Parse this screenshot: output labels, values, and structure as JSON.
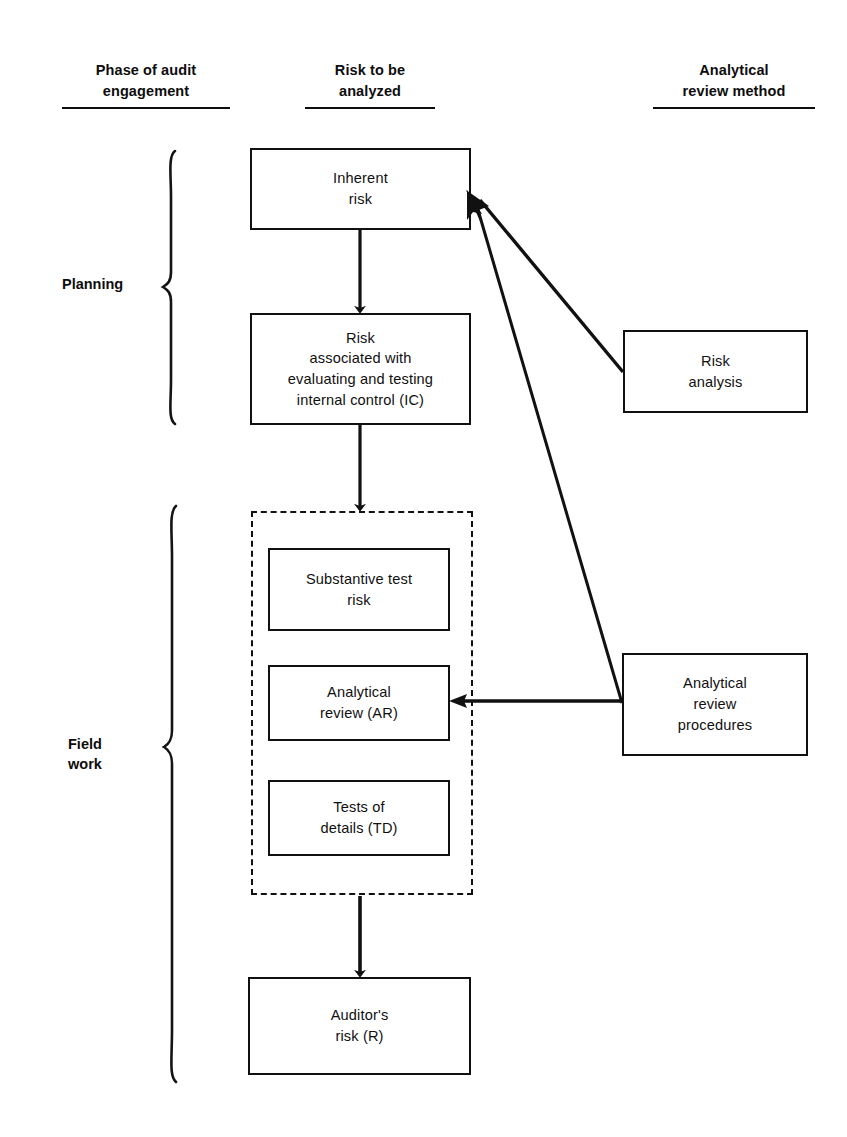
{
  "diagram": {
    "title_columns": [
      {
        "id": "phase",
        "text": "Phase of audit\nengagement"
      },
      {
        "id": "risk",
        "text": "Risk to be\nanalyzed"
      },
      {
        "id": "method",
        "text": "Analytical\nreview method"
      }
    ],
    "phases": [
      {
        "id": "planning",
        "label": "Planning"
      },
      {
        "id": "field-work",
        "label": "Field\nwork"
      }
    ],
    "nodes": [
      {
        "id": "inherent-risk",
        "label": "Inherent\nrisk"
      },
      {
        "id": "ic-risk",
        "label": "Risk\nassociated with\nevaluating and testing\ninternal control (IC)"
      },
      {
        "id": "substantive-test-risk",
        "label": "Substantive test\nrisk"
      },
      {
        "id": "analytical-review",
        "label": "Analytical\nreview (AR)"
      },
      {
        "id": "tests-of-details",
        "label": "Tests of\ndetails (TD)"
      },
      {
        "id": "auditors-risk",
        "label": "Auditor's\nrisk (R)"
      },
      {
        "id": "risk-analysis",
        "label": "Risk\nanalysis"
      },
      {
        "id": "analytical-review-procedures",
        "label": "Analytical\nreview\nprocedures"
      }
    ],
    "connectors": [
      {
        "id": "inherent-to-ic",
        "from": "inherent-risk",
        "to": "ic-risk",
        "style": "solid-arrow"
      },
      {
        "id": "ic-to-fieldwork-group",
        "from": "ic-risk",
        "to": "field-work-group",
        "style": "solid-arrow"
      },
      {
        "id": "fieldwork-group-to-auditors-risk",
        "from": "field-work-group",
        "to": "auditors-risk",
        "style": "solid-arrow"
      },
      {
        "id": "risk-analysis-to-inherent",
        "from": "risk-analysis",
        "to": "inherent-risk",
        "style": "solid-arrow"
      },
      {
        "id": "arp-to-inherent",
        "from": "analytical-review-procedures",
        "to": "inherent-risk",
        "style": "solid-arrow"
      },
      {
        "id": "arp-to-analytical-review",
        "from": "analytical-review-procedures",
        "to": "analytical-review",
        "style": "solid-arrow"
      }
    ],
    "colors": {
      "ink": "#111111",
      "background": "#ffffff"
    }
  }
}
